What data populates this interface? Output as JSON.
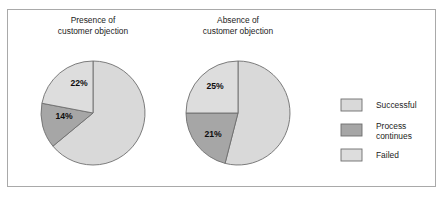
{
  "figure": {
    "background_color": "#ffffff",
    "frame_color": "#a9a9a9"
  },
  "chart_data": {
    "type": "pie",
    "title": "",
    "legend_position": "right",
    "categories": [
      "Successful",
      "Process continues",
      "Failed"
    ],
    "colors": {
      "Successful": "#d9d9d9",
      "Process continues": "#a6a6a6",
      "Failed": "#dddddd",
      "outline": "#6e6e6e"
    },
    "charts": [
      {
        "title_line1": "Presence of",
        "title_line2": "customer objection",
        "values": [
          64,
          14,
          22
        ],
        "labels_shown": [
          "",
          "14%",
          "22%"
        ],
        "center": [
          93,
          113
        ],
        "radius": 52
      },
      {
        "title_line1": "Absence of",
        "title_line2": "customer objection",
        "values": [
          54,
          21,
          25
        ],
        "labels_shown": [
          "",
          "21%",
          "25%"
        ],
        "center": [
          238,
          113
        ],
        "radius": 52
      }
    ]
  },
  "panels": [
    {
      "title_line1": "Presence of",
      "title_line2": "customer objection",
      "slice_label_failed": "22%",
      "slice_label_process": "14%"
    },
    {
      "title_line1": "Absence of",
      "title_line2": "customer objection",
      "slice_label_failed": "25%",
      "slice_label_process": "21%"
    }
  ],
  "legend": {
    "items": [
      {
        "label": "Successful",
        "color": "#d9d9d9"
      },
      {
        "label_line1": "Process",
        "label_line2": "continues",
        "color": "#a6a6a6"
      },
      {
        "label": "Failed",
        "color": "#dddddd"
      }
    ]
  }
}
